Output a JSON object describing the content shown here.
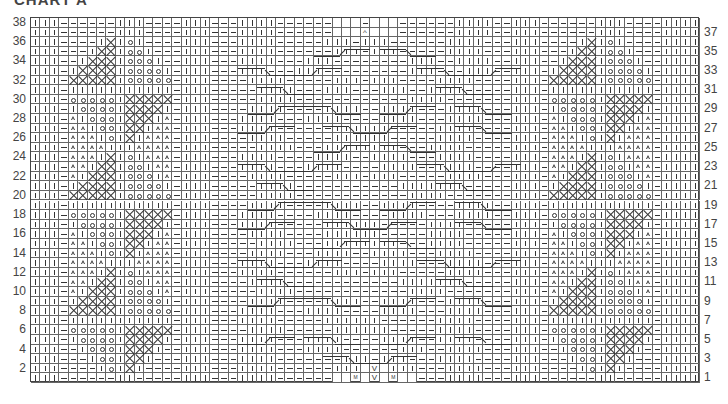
{
  "title": "CHART A",
  "chart": {
    "columns": 71,
    "rows": 38,
    "legend_codes": {
      "|": "knit",
      "-": "purl",
      "o": "bobble / yarn-over",
      "X": "cross stitch",
      "D": "triangle / twisted stitch",
      " ": "no stitch",
      "V": "increase",
      "M": "make one",
      "^": "decrease"
    },
    "left_row_numbers": [
      "38",
      "36",
      "34",
      "32",
      "30",
      "28",
      "26",
      "24",
      "22",
      "20",
      "18",
      "16",
      "14",
      "12",
      "10",
      "8",
      "6",
      "4",
      "2"
    ],
    "right_row_numbers": [
      "37",
      "35",
      "33",
      "31",
      "29",
      "27",
      "25",
      "23",
      "21",
      "19",
      "17",
      "15",
      "13",
      "11",
      "9",
      "7",
      "5",
      "3",
      "1"
    ],
    "side_blocks": {
      "38": [
        "-----",
        "||---"
      ],
      "37": [
        "-----",
        "||---"
      ],
      "36": [
        "---|X",
        "o|---"
      ],
      "35": [
        "--|XX",
        "oo|--"
      ],
      "34": [
        "-|XXX",
        "ooo|-"
      ],
      "33": [
        "|XXXX",
        "oooo|"
      ],
      "32": [
        "XXXXX",
        "ooooo"
      ],
      "31": [
        "|||||",
        "|||||"
      ],
      "30": [
        "ooooo",
        "XXXXX"
      ],
      "29": [
        "|oooo",
        "XXXX|"
      ],
      "28": [
        "D|ooo",
        "XXX|D"
      ],
      "27": [
        "DD|oo",
        "XX|DD"
      ],
      "26": [
        "DDD|o",
        "X|DDD"
      ],
      "25": [
        "DDDD|",
        "|DDDD"
      ],
      "24": [
        "DDD|X",
        "o|DDD"
      ],
      "23": [
        "DD|XX",
        "oo|DD"
      ],
      "22": [
        "D|XXX",
        "ooo|D"
      ],
      "21": [
        "|XXXX",
        "oooo|"
      ],
      "20": [
        "XXXXX",
        "ooooo"
      ],
      "19": [
        "|||||",
        "|||||"
      ],
      "18": [
        "ooooo",
        "XXXXX"
      ],
      "17": [
        "|oooo",
        "XXXX|"
      ],
      "16": [
        "D|ooo",
        "XXX|D"
      ],
      "15": [
        "DD|oo",
        "XX|DD"
      ],
      "14": [
        "DDD|o",
        "X|DDD"
      ],
      "13": [
        "DDDD|",
        "|DDDD"
      ],
      "12": [
        "DDD|X",
        "o|DDD"
      ],
      "11": [
        "DD|XX",
        "oo|DD"
      ],
      "10": [
        "D|XXX",
        "ooo|D"
      ],
      "9": [
        "|XXXX",
        "oooo|"
      ],
      "8": [
        "XXXXX",
        "ooooo"
      ],
      "7": [
        "|||||",
        "|||||"
      ],
      "6": [
        "ooooo",
        "XXXXX"
      ],
      "5": [
        "|oooo",
        "XXXX|"
      ],
      "4": [
        "-|ooo",
        "XXX|-"
      ],
      "3": [
        "--|oo",
        "XX|--"
      ],
      "2": [
        "---|o",
        "X|---"
      ],
      "1": [
        "-----",
        "|----"
      ]
    },
    "center_rows": {
      "38": "-||||------   -   ------||||-",
      "37": "-||||------   ^   ------||||-",
      "36": "-||||-----|||-|||------||||-",
      "35": "-||||------|||-|||-----||||-",
      "34": "-||||---|||--------|||--||||-",
      "33": "-|||---|||---------|||---|||-",
      "32": "--||||-----|||-|||----||||--",
      "31": "---||||---|||---|||--||||---",
      "30": "---||||------------||||-----",
      "29": "--||||----||||--||||---||||-",
      "28": "-||||---||||----||||---||||-",
      "27": "-||||------||||||-----||||--",
      "26": "--||||-----||||||-----||||--",
      "25": "---||||---||||||||---||||---",
      "24": "-||||----||||--||||---||||--",
      "23": "-||||---||||----||||--||||--",
      "22": "--||||-----|||-|||-----||||-",
      "21": "---||||-----------|||||||---",
      "20": "---||||------------||||-----",
      "19": "--||||----||||--||||----||||",
      "18": "-||||----||||----||||---||||",
      "17": "-||||-----||||||-----||||---",
      "16": "--||||----||||||-----||||---",
      "15": "---||||---||||||||---||||---",
      "14": "--||||---||||--||||---||||--",
      "13": "-||||---||||----||||---||||-",
      "12": "-||||------|||-|||-----||||-",
      "11": "--||||------------|||||||---",
      "10": "---||||------------||||-----",
      "9": "--||||----||||--||||---||||-",
      "8": "-||||---||||----||||---||||-",
      "7": "-||||-----||||||------||||--",
      "6": "--||||-----||||||-----||||--",
      "5": "-||||---||||----||||--||||--",
      "4": "-||||---||||------|||--||||-",
      "3": "-||||-------|||-|||---||||--",
      "2": "-||||------||| V |||---||||-",
      "1": "-||||------  M V M  ---||||-"
    },
    "cables": [
      {
        "row": 35,
        "col": 30,
        "span": 6,
        "dir": "up"
      },
      {
        "row": 35,
        "col": 37,
        "span": 6,
        "dir": "down"
      },
      {
        "row": 33,
        "col": 22,
        "span": 6,
        "dir": "down"
      },
      {
        "row": 33,
        "col": 27,
        "span": 6,
        "dir": "up"
      },
      {
        "row": 33,
        "col": 41,
        "span": 6,
        "dir": "down"
      },
      {
        "row": 33,
        "col": 46,
        "span": 6,
        "dir": "up"
      },
      {
        "row": 31,
        "col": 24,
        "span": 6,
        "dir": "down"
      },
      {
        "row": 31,
        "col": 43,
        "span": 6,
        "dir": "down"
      },
      {
        "row": 29,
        "col": 23,
        "span": 6,
        "dir": "up"
      },
      {
        "row": 29,
        "col": 29,
        "span": 6,
        "dir": "down"
      },
      {
        "row": 29,
        "col": 37,
        "span": 6,
        "dir": "up"
      },
      {
        "row": 29,
        "col": 45,
        "span": 6,
        "dir": "down"
      },
      {
        "row": 27,
        "col": 22,
        "span": 6,
        "dir": "up"
      },
      {
        "row": 27,
        "col": 31,
        "span": 6,
        "dir": "down"
      },
      {
        "row": 27,
        "col": 35,
        "span": 6,
        "dir": "up"
      },
      {
        "row": 27,
        "col": 45,
        "span": 6,
        "dir": "down"
      },
      {
        "row": 25,
        "col": 30,
        "span": 6,
        "dir": "up"
      },
      {
        "row": 25,
        "col": 37,
        "span": 6,
        "dir": "down"
      },
      {
        "row": 23,
        "col": 22,
        "span": 6,
        "dir": "down"
      },
      {
        "row": 23,
        "col": 27,
        "span": 6,
        "dir": "up"
      },
      {
        "row": 23,
        "col": 41,
        "span": 6,
        "dir": "down"
      },
      {
        "row": 23,
        "col": 46,
        "span": 6,
        "dir": "up"
      },
      {
        "row": 21,
        "col": 24,
        "span": 6,
        "dir": "down"
      },
      {
        "row": 21,
        "col": 43,
        "span": 6,
        "dir": "down"
      },
      {
        "row": 19,
        "col": 23,
        "span": 6,
        "dir": "up"
      },
      {
        "row": 19,
        "col": 29,
        "span": 6,
        "dir": "down"
      },
      {
        "row": 19,
        "col": 37,
        "span": 6,
        "dir": "up"
      },
      {
        "row": 19,
        "col": 45,
        "span": 6,
        "dir": "down"
      },
      {
        "row": 17,
        "col": 22,
        "span": 6,
        "dir": "up"
      },
      {
        "row": 17,
        "col": 31,
        "span": 6,
        "dir": "down"
      },
      {
        "row": 17,
        "col": 35,
        "span": 6,
        "dir": "up"
      },
      {
        "row": 17,
        "col": 45,
        "span": 6,
        "dir": "down"
      },
      {
        "row": 15,
        "col": 30,
        "span": 6,
        "dir": "up"
      },
      {
        "row": 15,
        "col": 37,
        "span": 6,
        "dir": "down"
      },
      {
        "row": 13,
        "col": 22,
        "span": 6,
        "dir": "down"
      },
      {
        "row": 13,
        "col": 27,
        "span": 6,
        "dir": "up"
      },
      {
        "row": 13,
        "col": 41,
        "span": 6,
        "dir": "down"
      },
      {
        "row": 13,
        "col": 46,
        "span": 6,
        "dir": "up"
      },
      {
        "row": 11,
        "col": 24,
        "span": 6,
        "dir": "down"
      },
      {
        "row": 11,
        "col": 43,
        "span": 6,
        "dir": "down"
      },
      {
        "row": 9,
        "col": 23,
        "span": 6,
        "dir": "up"
      },
      {
        "row": 9,
        "col": 29,
        "span": 6,
        "dir": "down"
      },
      {
        "row": 9,
        "col": 37,
        "span": 6,
        "dir": "up"
      },
      {
        "row": 9,
        "col": 45,
        "span": 6,
        "dir": "down"
      },
      {
        "row": 5,
        "col": 22,
        "span": 6,
        "dir": "up"
      },
      {
        "row": 5,
        "col": 29,
        "span": 6,
        "dir": "down"
      },
      {
        "row": 5,
        "col": 37,
        "span": 6,
        "dir": "up"
      },
      {
        "row": 5,
        "col": 45,
        "span": 6,
        "dir": "down"
      },
      {
        "row": 3,
        "col": 31,
        "span": 6,
        "dir": "down"
      },
      {
        "row": 3,
        "col": 35,
        "span": 6,
        "dir": "up"
      }
    ]
  }
}
